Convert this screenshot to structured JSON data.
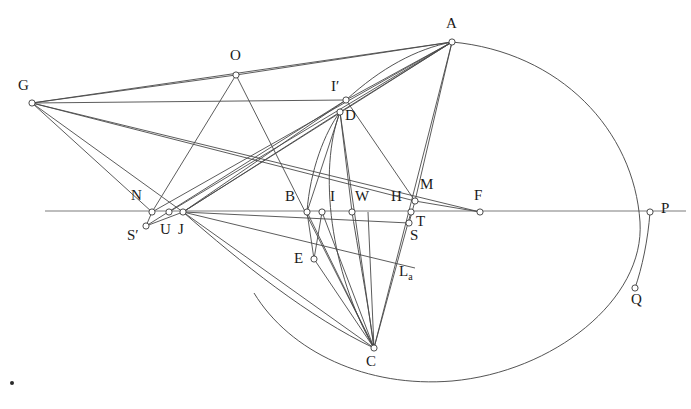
{
  "figure": {
    "width": 691,
    "height": 409,
    "background_color": "#ffffff",
    "line_color": "#4a4a4a",
    "axis_color": "#7d7d7d",
    "node_fill_color": "#ffffff",
    "node_stroke_color": "#3a3a3a",
    "label_color": "#1a1a1a"
  },
  "points": [
    {
      "id": "A",
      "label": "A",
      "x": 452,
      "y": 42,
      "lx": 446,
      "ly": 16,
      "marked": true
    },
    {
      "id": "G",
      "label": "G",
      "x": 32,
      "y": 103,
      "lx": 18,
      "ly": 78,
      "marked": true
    },
    {
      "id": "O",
      "label": "O",
      "x": 236,
      "y": 75,
      "lx": 230,
      "ly": 48,
      "marked": true
    },
    {
      "id": "Ip",
      "label": "I′",
      "x": 346,
      "y": 100,
      "lx": 331,
      "ly": 79,
      "marked": true
    },
    {
      "id": "D",
      "label": "D",
      "x": 340,
      "y": 112,
      "lx": 345,
      "ly": 108,
      "marked": true
    },
    {
      "id": "N",
      "label": "N",
      "x": 152,
      "y": 212,
      "lx": 131,
      "ly": 188,
      "marked": true
    },
    {
      "id": "Sp",
      "label": "S′",
      "x": 146,
      "y": 226,
      "lx": 129,
      "ly": 228,
      "marked": true
    },
    {
      "id": "U",
      "label": "U",
      "x": 169,
      "y": 212,
      "lx": 161,
      "ly": 222,
      "marked": true
    },
    {
      "id": "J",
      "label": "J",
      "x": 183,
      "y": 212,
      "lx": 180,
      "ly": 222,
      "marked": true
    },
    {
      "id": "B",
      "label": "B",
      "x": 307,
      "y": 212,
      "lx": 285,
      "ly": 189,
      "marked": true
    },
    {
      "id": "X1",
      "label": "",
      "x": 322,
      "y": 212,
      "lx": 0,
      "ly": 0,
      "marked": true
    },
    {
      "id": "I",
      "label": "I",
      "x": 352,
      "y": 212,
      "lx": 329,
      "ly": 189,
      "marked": true
    },
    {
      "id": "W",
      "label": "W",
      "x": 368,
      "y": 212,
      "lx": 357,
      "ly": 189,
      "marked": false
    },
    {
      "id": "H",
      "label": "H",
      "x": 411,
      "y": 212,
      "lx": 392,
      "ly": 189,
      "marked": true
    },
    {
      "id": "M",
      "label": "M",
      "x": 415,
      "y": 201,
      "lx": 421,
      "ly": 178,
      "marked": true
    },
    {
      "id": "T",
      "label": "T",
      "x": 409,
      "y": 223,
      "lx": 416,
      "ly": 215,
      "marked": true
    },
    {
      "id": "S",
      "label": "S",
      "x": 409,
      "y": 223,
      "lx": 412,
      "ly": 229,
      "marked": false
    },
    {
      "id": "F",
      "label": "F",
      "x": 480,
      "y": 212,
      "lx": 474,
      "ly": 188,
      "marked": true
    },
    {
      "id": "P",
      "label": "P",
      "x": 650,
      "y": 212,
      "lx": 661,
      "ly": 202,
      "marked": true
    },
    {
      "id": "Q",
      "label": "Q",
      "x": 635,
      "y": 288,
      "lx": 631,
      "ly": 293,
      "marked": true
    },
    {
      "id": "E",
      "label": "E",
      "x": 314,
      "y": 259,
      "lx": 295,
      "ly": 252,
      "marked": true
    },
    {
      "id": "C",
      "label": "C",
      "x": 374,
      "y": 348,
      "lx": 366,
      "ly": 355,
      "marked": true
    },
    {
      "id": "La",
      "label": "La",
      "x": 404,
      "y": 270,
      "lx": 398,
      "ly": 266,
      "marked": false
    }
  ],
  "labels": [
    {
      "text": "A",
      "x": 446,
      "y": 16
    },
    {
      "text": "G",
      "x": 18,
      "y": 78
    },
    {
      "text": "O",
      "x": 230,
      "y": 48
    },
    {
      "text": "I′",
      "x": 331,
      "y": 79
    },
    {
      "text": "D",
      "x": 345,
      "y": 108
    },
    {
      "text": "N",
      "x": 131,
      "y": 188
    },
    {
      "text": "S′",
      "x": 127,
      "y": 228
    },
    {
      "text": "U",
      "x": 160,
      "y": 222
    },
    {
      "text": "J",
      "x": 178,
      "y": 222
    },
    {
      "text": "B",
      "x": 285,
      "y": 189
    },
    {
      "text": "I",
      "x": 330,
      "y": 189
    },
    {
      "text": "W",
      "x": 355,
      "y": 189
    },
    {
      "text": "H",
      "x": 391,
      "y": 189
    },
    {
      "text": "M",
      "x": 420,
      "y": 177
    },
    {
      "text": "T",
      "x": 416,
      "y": 214
    },
    {
      "text": "S",
      "x": 410,
      "y": 228
    },
    {
      "text": "F",
      "x": 474,
      "y": 188
    },
    {
      "text": "P",
      "x": 661,
      "y": 201
    },
    {
      "text": "Q",
      "x": 631,
      "y": 292
    },
    {
      "text": "E",
      "x": 294,
      "y": 251
    },
    {
      "text": "C",
      "x": 366,
      "y": 354
    },
    {
      "text": "L",
      "x": 399,
      "y": 264,
      "sub": "a"
    }
  ],
  "segments": [
    {
      "name": "axis-horizontal",
      "x1": 45,
      "y1": 211,
      "x2": 686,
      "y2": 211,
      "kind": "axis"
    },
    {
      "name": "G-O",
      "x1": 32,
      "y1": 103,
      "x2": 236,
      "y2": 75,
      "kind": "line"
    },
    {
      "name": "O-A",
      "x1": 236,
      "y1": 75,
      "x2": 452,
      "y2": 42,
      "kind": "line"
    },
    {
      "name": "G-Ip",
      "x1": 32,
      "y1": 103,
      "x2": 346,
      "y2": 100,
      "kind": "line"
    },
    {
      "name": "G-A-upper",
      "x1": 32,
      "y1": 103,
      "x2": 452,
      "y2": 42,
      "kind": "none"
    },
    {
      "name": "G-J",
      "x1": 32,
      "y1": 103,
      "x2": 183,
      "y2": 212,
      "kind": "line"
    },
    {
      "name": "G-N",
      "x1": 32,
      "y1": 103,
      "x2": 152,
      "y2": 212,
      "kind": "line"
    },
    {
      "name": "G-M",
      "x1": 32,
      "y1": 103,
      "x2": 415,
      "y2": 201,
      "kind": "line"
    },
    {
      "name": "G-F",
      "x1": 32,
      "y1": 103,
      "x2": 480,
      "y2": 212,
      "kind": "none"
    },
    {
      "name": "O-N",
      "x1": 236,
      "y1": 75,
      "x2": 152,
      "y2": 212,
      "kind": "line"
    },
    {
      "name": "O-C",
      "x1": 236,
      "y1": 75,
      "x2": 374,
      "y2": 348,
      "kind": "line"
    },
    {
      "name": "J-Ip",
      "x1": 183,
      "y1": 212,
      "x2": 346,
      "y2": 100,
      "kind": "line"
    },
    {
      "name": "J-D",
      "x1": 183,
      "y1": 212,
      "x2": 340,
      "y2": 112,
      "kind": "line"
    },
    {
      "name": "J-A-1",
      "x1": 183,
      "y1": 212,
      "x2": 452,
      "y2": 42,
      "kind": "line"
    },
    {
      "name": "U-A",
      "x1": 169,
      "y1": 212,
      "x2": 452,
      "y2": 42,
      "kind": "line"
    },
    {
      "name": "N-A",
      "x1": 152,
      "y1": 212,
      "x2": 452,
      "y2": 42,
      "kind": "line"
    },
    {
      "name": "Ip-A",
      "x1": 346,
      "y1": 100,
      "x2": 452,
      "y2": 42,
      "kind": "line"
    },
    {
      "name": "D-A",
      "x1": 340,
      "y1": 112,
      "x2": 452,
      "y2": 42,
      "kind": "line"
    },
    {
      "name": "A-M",
      "x1": 452,
      "y1": 42,
      "x2": 415,
      "y2": 201,
      "kind": "line"
    },
    {
      "name": "A-C",
      "x1": 452,
      "y1": 42,
      "x2": 374,
      "y2": 348,
      "kind": "none"
    },
    {
      "name": "Sp-J",
      "x1": 146,
      "y1": 226,
      "x2": 183,
      "y2": 212,
      "kind": "line"
    },
    {
      "name": "Sp-N",
      "x1": 146,
      "y1": 226,
      "x2": 152,
      "y2": 212,
      "kind": "line"
    },
    {
      "name": "Sp-Ip",
      "x1": 146,
      "y1": 226,
      "x2": 346,
      "y2": 100,
      "kind": "line"
    },
    {
      "name": "J-C",
      "x1": 183,
      "y1": 212,
      "x2": 374,
      "y2": 348,
      "kind": "line"
    },
    {
      "name": "J-S",
      "x1": 183,
      "y1": 212,
      "x2": 409,
      "y2": 223,
      "kind": "line"
    },
    {
      "name": "J-La",
      "x1": 183,
      "y1": 212,
      "x2": 415,
      "y2": 268,
      "kind": "line"
    },
    {
      "name": "B-C",
      "x1": 307,
      "y1": 212,
      "x2": 374,
      "y2": 348,
      "kind": "line"
    },
    {
      "name": "X1-C",
      "x1": 322,
      "y1": 212,
      "x2": 374,
      "y2": 348,
      "kind": "line"
    },
    {
      "name": "W-C",
      "x1": 368,
      "y1": 212,
      "x2": 374,
      "y2": 348,
      "kind": "line"
    },
    {
      "name": "H-C",
      "x1": 411,
      "y1": 212,
      "x2": 374,
      "y2": 348,
      "kind": "line"
    },
    {
      "name": "E-C",
      "x1": 314,
      "y1": 259,
      "x2": 374,
      "y2": 348,
      "kind": "line"
    },
    {
      "name": "B-E",
      "x1": 307,
      "y1": 212,
      "x2": 314,
      "y2": 259,
      "kind": "line"
    },
    {
      "name": "X1-E",
      "x1": 322,
      "y1": 212,
      "x2": 314,
      "y2": 259,
      "kind": "line"
    },
    {
      "name": "D-B",
      "x1": 340,
      "y1": 112,
      "x2": 307,
      "y2": 212,
      "kind": "none"
    },
    {
      "name": "D-I",
      "x1": 340,
      "y1": 112,
      "x2": 352,
      "y2": 212,
      "kind": "line"
    },
    {
      "name": "D-C",
      "x1": 340,
      "y1": 112,
      "x2": 374,
      "y2": 348,
      "kind": "none"
    },
    {
      "name": "M-T-vert",
      "x1": 415,
      "y1": 201,
      "x2": 409,
      "y2": 223,
      "kind": "line"
    },
    {
      "name": "M-F",
      "x1": 415,
      "y1": 201,
      "x2": 480,
      "y2": 212,
      "kind": "line"
    },
    {
      "name": "M-Ip-chord",
      "x1": 415,
      "y1": 201,
      "x2": 346,
      "y2": 100,
      "kind": "none"
    }
  ],
  "arcs": [
    {
      "name": "main-circle-APQC",
      "d": "M 452 42 C 560 52 634 130 640 222 C 645 300 553 372 452 381 C 367 388 290 352 254 293",
      "kind": "arc"
    },
    {
      "name": "arc-left-lower-C",
      "d": "M 183 212 C 240 262 310 318 374 348",
      "kind": "arc"
    },
    {
      "name": "arc-Ip-to-A",
      "d": "M 346 100 C 381 68 416 49 452 42",
      "kind": "arc"
    },
    {
      "name": "arc-D-to-C",
      "d": "M 340 112 C 318 170 330 272 374 348",
      "kind": "arc"
    },
    {
      "name": "arc-B-up",
      "d": "M 307 212 C 310 170 325 132 340 112",
      "kind": "arc"
    },
    {
      "name": "arc-I-to-C",
      "d": "M 352 212 C 360 262 370 315 374 348",
      "kind": "arc"
    },
    {
      "name": "arc-P-to-Q",
      "d": "M 650 212 C 648 240 642 268 635 288",
      "kind": "arc"
    }
  ],
  "stray_dot": {
    "name": "stray-dot",
    "x": 12,
    "y": 383,
    "r": 2
  }
}
